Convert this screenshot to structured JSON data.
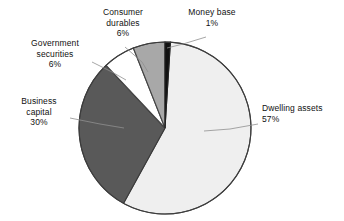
{
  "chart_data": {
    "type": "pie",
    "title": "",
    "subtitle": "",
    "xlabel": "",
    "ylabel": "",
    "legend_position": "none",
    "labels_position": "outside-with-leader-lines",
    "grid": false,
    "total_percent": 100,
    "start_angle_deg": 0,
    "direction": "clockwise",
    "categories": [
      "Money base",
      "Dwelling assets",
      "Business capital",
      "Government securities",
      "Consumer durables"
    ],
    "values": [
      1,
      57,
      30,
      6,
      6
    ],
    "value_labels": [
      "1%",
      "57%",
      "30%",
      "6%",
      "6%"
    ],
    "colors": [
      "#111111",
      "#efefef",
      "#595959",
      "#ffffff",
      "#a8a8a8"
    ],
    "slices": [
      {
        "name": "Money base",
        "name_line1": "Money base",
        "name_line2": "",
        "value": 1,
        "value_label": "1%",
        "color": "#111111",
        "stroke": "#222222"
      },
      {
        "name": "Dwelling assets",
        "name_line1": "Dwelling assets",
        "name_line2": "",
        "value": 57,
        "value_label": "57%",
        "color": "#efefef",
        "stroke": "#444444"
      },
      {
        "name": "Business capital",
        "name_line1": "Business",
        "name_line2": "capital",
        "value": 30,
        "value_label": "30%",
        "color": "#595959",
        "stroke": "#3a3a3a"
      },
      {
        "name": "Government securities",
        "name_line1": "Government",
        "name_line2": "securities",
        "value": 6,
        "value_label": "6%",
        "color": "#ffffff",
        "stroke": "#444444"
      },
      {
        "name": "Consumer durables",
        "name_line1": "Consumer",
        "name_line2": "durables",
        "value": 6,
        "value_label": "6%",
        "color": "#a8a8a8",
        "stroke": "#444444"
      }
    ]
  },
  "labels": {
    "consumer_durables": {
      "line1": "Consumer",
      "line2": "durables",
      "value": "6%"
    },
    "money_base": {
      "line1": "Money base",
      "line2": "",
      "value": "1%"
    },
    "government_securities": {
      "line1": "Government",
      "line2": "securities",
      "value": "6%"
    },
    "business_capital": {
      "line1": "Business",
      "line2": "capital",
      "value": "30%"
    },
    "dwelling_assets": {
      "line1": "Dwelling assets",
      "line2": "",
      "value": "57%"
    }
  },
  "colors": {
    "background": "#ffffff",
    "outline": "#3d3d3d",
    "text": "#111111",
    "leader_line": "#8a8a8a",
    "money_base": "#111111",
    "dwelling_assets": "#efefef",
    "business_capital": "#595959",
    "government_securities": "#ffffff",
    "consumer_durables": "#a8a8a8"
  }
}
